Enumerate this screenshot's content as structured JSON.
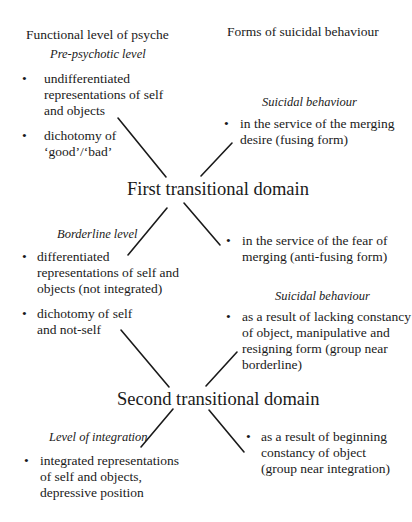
{
  "headers": {
    "left": "Functional level of psyche",
    "right": "Forms of suicidal behaviour"
  },
  "levels": {
    "pre_psychotic": {
      "label": "Pre-psychotic level",
      "bullets": [
        [
          "undifferentiated",
          "representations of self",
          "and objects"
        ],
        [
          "dichotomy of",
          "‘good’/‘bad’"
        ]
      ]
    },
    "borderline": {
      "label": "Borderline level",
      "bullets": [
        [
          "differentiated",
          "representations of self and",
          "objects (not integrated)"
        ],
        [
          "dichotomy of self",
          "and not-self"
        ]
      ]
    },
    "integration": {
      "label": "Level of integration",
      "bullets": [
        [
          "integrated representations",
          "of self and objects,",
          "depressive position"
        ]
      ]
    }
  },
  "suicidal": {
    "first_label": "Suicidal behaviour",
    "first_bullets": [
      [
        "in the service of the merging",
        "desire (fusing form)"
      ],
      [
        "in the service of the fear of",
        "merging (anti-fusing form)"
      ]
    ],
    "second_label": "Suicidal behaviour",
    "second_bullets": [
      [
        "as a result of lacking constancy",
        "of object, manipulative and",
        "resigning form (group near",
        "borderline)"
      ],
      [
        "as a result of beginning",
        "constancy of object",
        "(group near integration)"
      ]
    ]
  },
  "domains": {
    "first": "First transitional domain",
    "second": "Second transitional domain"
  },
  "bullet_glyph": "•"
}
